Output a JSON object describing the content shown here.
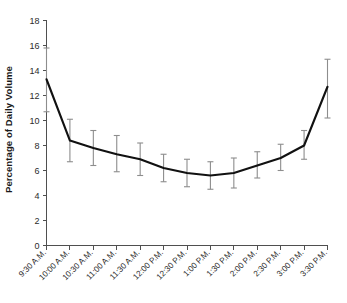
{
  "chart_data": {
    "type": "line",
    "title": "",
    "xlabel": "",
    "ylabel": "Percentage of Daily Volume",
    "ylim": [
      0,
      18
    ],
    "yticks": [
      0,
      2,
      4,
      6,
      8,
      10,
      12,
      14,
      16,
      18
    ],
    "ytick_labels": [
      "0",
      "2",
      "4",
      "6",
      "8",
      "10",
      "12",
      "14",
      "16",
      "18"
    ],
    "grid": false,
    "legend": null,
    "error_bars": "vertical, symmetric-ish, capped",
    "categories": [
      "9:30 A.M.",
      "10:00 A.M.",
      "10:30 A.M.",
      "11:00 A.M.",
      "11:30 A.M.",
      "12:00 P.M.",
      "12:30 P.M.",
      "1:00 P.M.",
      "1:30 P.M.",
      "2:00 P.M.",
      "2:30 P.M.",
      "3:00 P.M.",
      "3:30 P.M."
    ],
    "values": [
      13.3,
      8.4,
      7.8,
      7.3,
      6.9,
      6.2,
      5.8,
      5.6,
      5.8,
      6.4,
      7.0,
      8.0,
      12.7
    ],
    "err_low": [
      10.7,
      6.7,
      6.4,
      5.9,
      5.6,
      5.1,
      4.7,
      4.5,
      4.6,
      5.4,
      6.0,
      6.9,
      10.2
    ],
    "err_high": [
      15.8,
      10.1,
      9.2,
      8.8,
      8.2,
      7.3,
      6.9,
      6.7,
      7.0,
      7.5,
      8.1,
      9.2,
      14.9
    ],
    "series": [
      {
        "name": "Percentage of Daily Volume",
        "values": [
          13.3,
          8.4,
          7.8,
          7.3,
          6.9,
          6.2,
          5.8,
          5.6,
          5.8,
          6.4,
          7.0,
          8.0,
          12.7
        ]
      }
    ]
  },
  "style": {
    "line_color": "#111111",
    "error_color": "#8d8d8d",
    "axis_color": "#4f4f4f",
    "background": "#ffffff"
  }
}
